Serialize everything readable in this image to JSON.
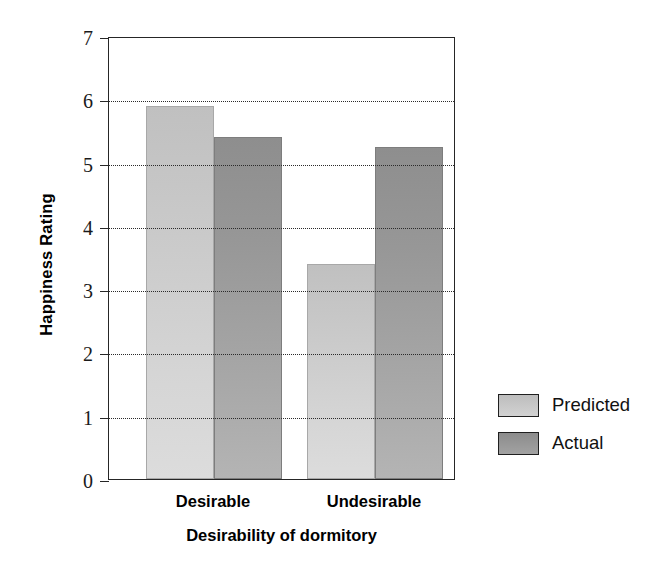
{
  "chart_data": {
    "type": "bar",
    "title": "",
    "xlabel": "Desirability of dormitory",
    "ylabel": "Happiness Rating",
    "categories": [
      "Desirable",
      "Undesirable"
    ],
    "series": [
      {
        "name": "Predicted",
        "values": [
          5.9,
          3.4
        ],
        "color": "#cacaca"
      },
      {
        "name": "Actual",
        "values": [
          5.4,
          5.25
        ],
        "color": "#9a9a9a"
      }
    ],
    "ylim": [
      0,
      7
    ],
    "yticks": [
      0,
      1,
      2,
      3,
      4,
      5,
      6,
      7
    ],
    "ytick_labels": [
      "0",
      "1",
      "2",
      "3",
      "4",
      "5",
      "6",
      "7"
    ],
    "gridlines": [
      1,
      2,
      3,
      4,
      5,
      6
    ],
    "grid": true,
    "grid_style": "dotted",
    "legend_position": "right"
  },
  "axes": {
    "y_title": "Happiness Rating",
    "x_title": "Desirability of dormitory"
  },
  "legend": {
    "items": [
      {
        "label": "Predicted",
        "color": "#cacaca"
      },
      {
        "label": "Actual",
        "color": "#9a9a9a"
      }
    ]
  }
}
